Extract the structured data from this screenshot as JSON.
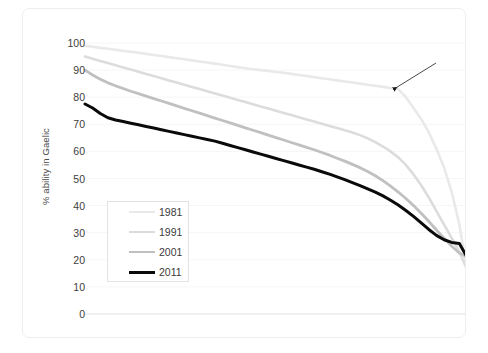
{
  "chart_data": {
    "type": "line",
    "title": "",
    "xlabel": "",
    "ylabel": "% ability in Gaelic",
    "ylim": [
      0,
      100
    ],
    "ytick_labels": [
      "100",
      "90",
      "80",
      "70",
      "60",
      "50",
      "40",
      "30",
      "20",
      "10",
      "0"
    ],
    "ytick_values": [
      100,
      90,
      80,
      70,
      60,
      50,
      40,
      30,
      20,
      10,
      0
    ],
    "xlim": [
      0,
      100
    ],
    "grid": "horizontal-faint",
    "legend_position": "inner-left-lower",
    "x": [
      0,
      2,
      4,
      6,
      8,
      10,
      12,
      14,
      16,
      18,
      20,
      22,
      24,
      26,
      28,
      30,
      32,
      34,
      36,
      38,
      40,
      42,
      44,
      46,
      48,
      50,
      52,
      54,
      56,
      58,
      60,
      62,
      64,
      66,
      68,
      70,
      72,
      74,
      76,
      78,
      80,
      82,
      84,
      86,
      88,
      90,
      92,
      94,
      96,
      98,
      100
    ],
    "series": [
      {
        "name": "1981",
        "color": "#e9e9e9",
        "width": 2.6,
        "values": [
          99.0,
          98.6,
          98.2,
          97.9,
          97.5,
          97.1,
          96.8,
          96.4,
          96.0,
          95.6,
          95.2,
          94.8,
          94.4,
          94.0,
          93.6,
          93.2,
          92.8,
          92.4,
          92.0,
          91.5,
          91.1,
          90.7,
          90.3,
          90.0,
          89.7,
          89.3,
          89.0,
          88.6,
          88.2,
          87.8,
          87.4,
          87.0,
          86.6,
          86.2,
          85.8,
          85.4,
          85.0,
          84.6,
          84.2,
          83.8,
          83.4,
          83.0,
          80.0,
          76.0,
          72.0,
          67.0,
          61.0,
          54.0,
          45.0,
          33.0,
          16.0
        ]
      },
      {
        "name": "1991",
        "color": "#dcdcdc",
        "width": 2.6,
        "values": [
          95.0,
          94.2,
          93.4,
          92.6,
          91.8,
          91.0,
          90.2,
          89.4,
          88.6,
          87.8,
          87.0,
          86.2,
          85.4,
          84.6,
          83.8,
          83.0,
          82.2,
          81.4,
          80.6,
          79.8,
          79.0,
          78.2,
          77.4,
          76.6,
          75.8,
          75.0,
          74.2,
          73.4,
          72.6,
          71.8,
          71.0,
          70.2,
          69.4,
          68.6,
          67.8,
          67.0,
          66.0,
          64.8,
          63.4,
          61.8,
          60.0,
          57.8,
          55.0,
          51.5,
          47.5,
          43.0,
          38.0,
          33.0,
          28.0,
          23.0,
          16.5
        ]
      },
      {
        "name": "2001",
        "color": "#c0c0c0",
        "width": 2.8,
        "values": [
          90.0,
          88.2,
          86.6,
          85.3,
          84.2,
          83.2,
          82.2,
          81.3,
          80.4,
          79.5,
          78.6,
          77.7,
          76.8,
          75.9,
          75.0,
          74.1,
          73.2,
          72.3,
          71.4,
          70.5,
          69.6,
          68.7,
          67.8,
          66.9,
          66.0,
          65.1,
          64.2,
          63.3,
          62.4,
          61.5,
          60.6,
          59.6,
          58.6,
          57.5,
          56.4,
          55.2,
          54.0,
          52.6,
          51.0,
          49.2,
          47.2,
          45.0,
          42.6,
          40.0,
          37.2,
          34.2,
          31.0,
          28.0,
          25.0,
          22.5,
          21.0
        ]
      },
      {
        "name": "2011",
        "color": "#0a0a0a",
        "width": 3.0,
        "values": [
          77.5,
          76.0,
          74.0,
          72.4,
          71.6,
          71.0,
          70.4,
          69.8,
          69.2,
          68.6,
          68.0,
          67.4,
          66.8,
          66.2,
          65.6,
          65.0,
          64.4,
          63.8,
          63.0,
          62.2,
          61.4,
          60.6,
          59.8,
          59.0,
          58.2,
          57.4,
          56.6,
          55.8,
          55.0,
          54.2,
          53.4,
          52.5,
          51.6,
          50.6,
          49.6,
          48.5,
          47.4,
          46.2,
          45.0,
          43.6,
          42.0,
          40.2,
          38.2,
          36.0,
          33.6,
          31.2,
          29.0,
          27.4,
          26.4,
          26.0,
          21.0
        ]
      }
    ],
    "annotations": [
      {
        "type": "arrow",
        "from_px": [
          435,
          62
        ],
        "to_px": [
          393,
          88
        ],
        "note": "arrow pointing at 1981 series kink"
      }
    ]
  },
  "legend": {
    "items": [
      {
        "label": "1981"
      },
      {
        "label": "1991"
      },
      {
        "label": "2001"
      },
      {
        "label": "2011"
      }
    ]
  }
}
